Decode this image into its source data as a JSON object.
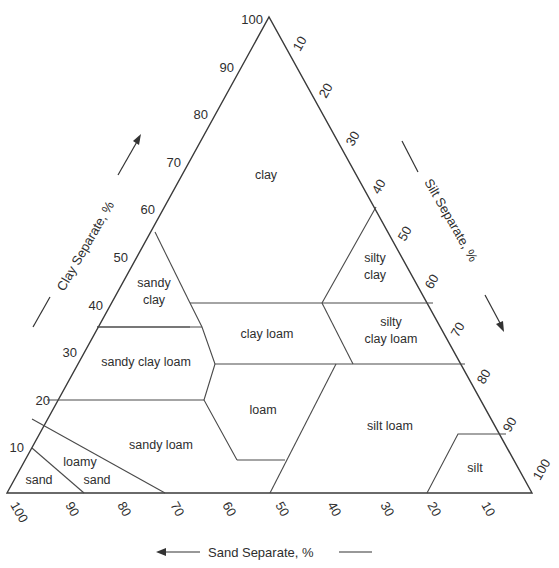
{
  "diagram": {
    "type": "ternary",
    "colors": {
      "line": "#3a3a3a",
      "text": "#2e2e2e",
      "background": "#ffffff"
    },
    "axes": {
      "clay": {
        "title": "Clay Separate, %",
        "ticks": [
          "10",
          "20",
          "30",
          "40",
          "50",
          "60",
          "70",
          "80",
          "90",
          "100"
        ],
        "direction": "up"
      },
      "silt": {
        "title": "Silt Separate, %",
        "ticks": [
          "10",
          "20",
          "30",
          "40",
          "50",
          "60",
          "70",
          "80",
          "90",
          "100"
        ],
        "direction": "down-right"
      },
      "sand": {
        "title": "Sand Separate, %",
        "ticks": [
          "100",
          "90",
          "80",
          "70",
          "60",
          "50",
          "40",
          "30",
          "20",
          "10"
        ],
        "direction": "left"
      }
    },
    "classes": [
      {
        "name": "clay",
        "lines": [
          "clay"
        ]
      },
      {
        "name": "sandy clay",
        "lines": [
          "sandy",
          "clay"
        ]
      },
      {
        "name": "silty clay",
        "lines": [
          "silty",
          "clay"
        ]
      },
      {
        "name": "clay loam",
        "lines": [
          "clay loam"
        ]
      },
      {
        "name": "silty clay loam",
        "lines": [
          "silty",
          "clay loam"
        ]
      },
      {
        "name": "sandy clay loam",
        "lines": [
          "sandy clay loam"
        ]
      },
      {
        "name": "loam",
        "lines": [
          "loam"
        ]
      },
      {
        "name": "silt loam",
        "lines": [
          "silt loam"
        ]
      },
      {
        "name": "sandy loam",
        "lines": [
          "sandy loam"
        ]
      },
      {
        "name": "loamy sand",
        "lines": [
          "loamy",
          "sand"
        ]
      },
      {
        "name": "sand",
        "lines": [
          "sand"
        ]
      },
      {
        "name": "silt",
        "lines": [
          "silt"
        ]
      }
    ]
  }
}
